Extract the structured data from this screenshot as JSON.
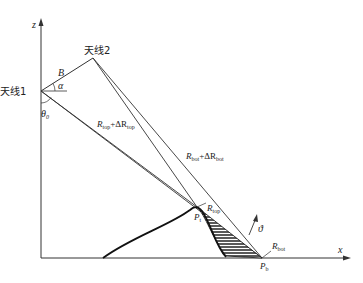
{
  "diagram": {
    "axes": {
      "z_label": "z",
      "x_label": "x"
    },
    "antenna1": {
      "label": "天线1"
    },
    "antenna2": {
      "label": "天线2"
    },
    "baseline_label": "B",
    "angle_alpha": "α",
    "angle_theta": "θ",
    "theta_sub": "0",
    "slant_top": {
      "R": "R",
      "sub": "top",
      "plus": "+ΔR",
      "sub2": "top"
    },
    "slant_bot": {
      "R": "R",
      "sub": "bot",
      "plus": "+ΔR",
      "sub2": "bot"
    },
    "point_top": {
      "R": "R",
      "sub": "top",
      "P": "P",
      "psub": "t"
    },
    "point_bot": {
      "R": "R",
      "sub": "bot",
      "P": "P",
      "psub": "b"
    },
    "normal_label": "ϑ"
  }
}
